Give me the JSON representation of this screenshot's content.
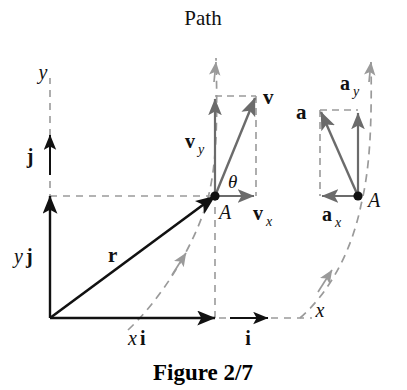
{
  "figure": {
    "caption": "Figure 2/7",
    "path_label": "Path",
    "axes": {
      "x_label": "x",
      "y_label": "y"
    },
    "points": {
      "a_velocity": "A",
      "a_acceleration": "A"
    },
    "angle_label": "θ",
    "unit_vectors": {
      "i": "i",
      "j": "j"
    },
    "position_vectors": {
      "r": "r",
      "x_component_scalar": "x",
      "x_component_unit": "i",
      "y_component_scalar": "y",
      "y_component_unit": "j"
    },
    "velocity_vectors": {
      "v": "v",
      "vx_base": "v",
      "vx_sub": "x",
      "vy_base": "v",
      "vy_sub": "y"
    },
    "acceleration_vectors": {
      "a": "a",
      "ax_base": "a",
      "ax_sub": "x",
      "ay_base": "a",
      "ay_sub": "y"
    },
    "colors": {
      "solid_black": "#111111",
      "vector_gray": "#6b6b6b",
      "dashed_gray": "#9a9a9a",
      "background": "#ffffff"
    }
  }
}
